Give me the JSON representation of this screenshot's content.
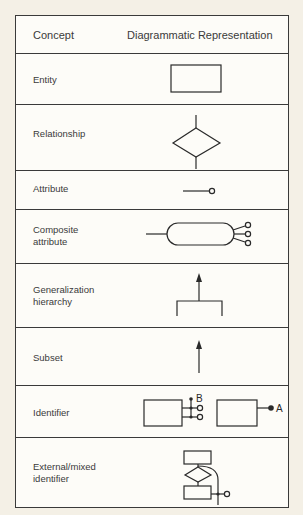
{
  "header": {
    "concept": "Concept",
    "representation": "Diagrammatic Representation"
  },
  "rows": [
    {
      "concept": "Entity",
      "symbol": "rectangle"
    },
    {
      "concept": "Relationship",
      "symbol": "diamond"
    },
    {
      "concept": "Attribute",
      "symbol": "line-with-open-circle"
    },
    {
      "concept": "Composite\nattribute",
      "symbol": "oval-with-three-open-circles"
    },
    {
      "concept": "Generalization\nhierarchy",
      "symbol": "arrow-up-with-bracket"
    },
    {
      "concept": "Subset",
      "symbol": "arrow-up"
    },
    {
      "concept": "Identifier",
      "symbol": "entities-with-identifiers",
      "labels": [
        "B",
        "A"
      ]
    },
    {
      "concept": "External/mixed\nidentifier",
      "symbol": "entity-relationship-entity-identifier"
    }
  ],
  "colors": {
    "page_background": "#f4f0e6",
    "table_background": "#fdfcf8",
    "line": "#2a2a2a"
  }
}
